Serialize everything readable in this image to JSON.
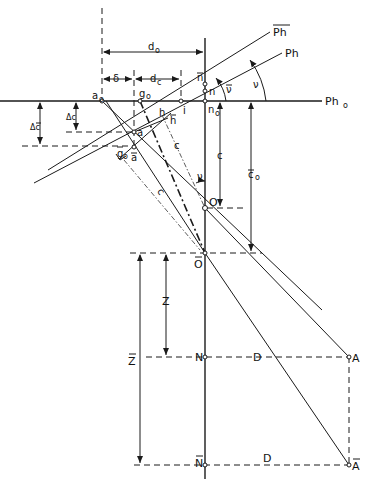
{
  "figure": {
    "type": "geometric construction diagram",
    "colors": {
      "ink": "#1a1a1a",
      "background": "#ffffff"
    },
    "labels": {
      "Ph_bar": "Ph",
      "Ph": "Ph",
      "Ph0": "Ph",
      "Ph0_sub": "o",
      "d0": "d",
      "d0_sub": "o",
      "dc": "d",
      "dc_sub": "c",
      "delta": "δ",
      "n_bar": "n",
      "n": "n",
      "n0": "n",
      "n0_sub": "o",
      "nu_bar": "ν",
      "nu": "ν",
      "nu_lower": "ν",
      "i": "i",
      "a0": "a",
      "a0_sub": "o",
      "g0": "g",
      "g0_sub": "o",
      "h": "h",
      "h_bar": "h",
      "a": "a",
      "a_bar": "a",
      "g0_bar": "g",
      "g0_bar_sub": "o",
      "delta_c": "Δc",
      "delta_c_bar": "Δc",
      "c": "c",
      "c_right": "c",
      "c0_bar": "c",
      "c0_bar_sub": "o",
      "c_bar": "c",
      "O": "O",
      "O_bar": "O",
      "Z": "Z",
      "Z_bar": "Z",
      "N": "N",
      "N_bar": "N",
      "D_upper": "D",
      "D_lower": "D",
      "A": "A",
      "A_bar": "A"
    },
    "points": [
      "a₀",
      "g₀",
      "i",
      "n₀",
      "n",
      "n̄",
      "a",
      "ā",
      "ḡ₀",
      "h",
      "h̄",
      "O",
      "Ō",
      "N",
      "N̄",
      "A",
      "Ā"
    ],
    "lines": [
      "Ph",
      "P̄h",
      "Ph₀"
    ]
  }
}
